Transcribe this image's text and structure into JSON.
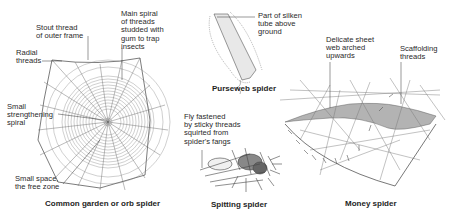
{
  "figures": {
    "orb": {
      "caption": "Common garden or orb spider",
      "labels": {
        "outer_frame": "Stout thread\nof outer frame",
        "main_spiral": "Main spiral\nof threads\nstudded with\ngum to trap\ninsects",
        "radial": "Radial\nthreads",
        "strengthening": "Small\nstrengthening\nspiral",
        "free_zone": "Small space,\nthe free zone"
      }
    },
    "purseweb": {
      "caption": "Purseweb spider",
      "labels": {
        "tube": "Part of silken\ntube above\nground"
      }
    },
    "spitting": {
      "caption": "Spitting spider",
      "labels": {
        "fly": "Fly fastened\nby sticky threads\nsquirted from\nspider's fangs"
      }
    },
    "money": {
      "caption": "Money spider",
      "labels": {
        "sheet": "Delicate sheet\nweb arched\nupwards",
        "scaffolding": "Scaffolding\nthreads"
      }
    }
  },
  "colors": {
    "ink": "#2a2a2a",
    "background": "#ffffff"
  }
}
